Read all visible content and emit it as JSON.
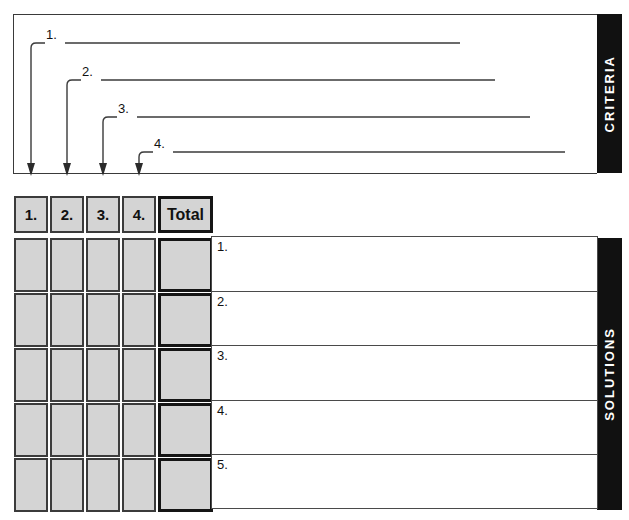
{
  "labels": {
    "criteria_bar": "CRITERIA",
    "solutions_bar": "SOLUTIONS"
  },
  "criteria": {
    "items": [
      {
        "number": "1.",
        "line_y": 43,
        "line_end_x": 460,
        "stem_x": 31
      },
      {
        "number": "2.",
        "line_y": 80,
        "line_end_x": 495,
        "stem_x": 67
      },
      {
        "number": "3.",
        "line_y": 117,
        "line_end_x": 530,
        "stem_x": 103
      },
      {
        "number": "4.",
        "line_y": 152,
        "line_end_x": 565,
        "stem_x": 139
      }
    ]
  },
  "grid": {
    "column_headers": [
      "1.",
      "2.",
      "3.",
      "4."
    ],
    "total_header": "Total",
    "row_count": 5,
    "cell_values": [
      [
        "",
        "",
        "",
        "",
        ""
      ],
      [
        "",
        "",
        "",
        "",
        ""
      ],
      [
        "",
        "",
        "",
        "",
        ""
      ],
      [
        "",
        "",
        "",
        "",
        ""
      ],
      [
        "",
        "",
        "",
        "",
        ""
      ]
    ]
  },
  "solutions": {
    "rows": [
      {
        "number": "1.",
        "text": ""
      },
      {
        "number": "2.",
        "text": ""
      },
      {
        "number": "3.",
        "text": ""
      },
      {
        "number": "4.",
        "text": ""
      },
      {
        "number": "5.",
        "text": ""
      }
    ]
  },
  "colors": {
    "cell_fill": "#d4d4d4",
    "cell_border": "#3b3b3b",
    "bar_background": "#111111",
    "bar_text": "#ffffff",
    "line": "#3a3a3a"
  }
}
